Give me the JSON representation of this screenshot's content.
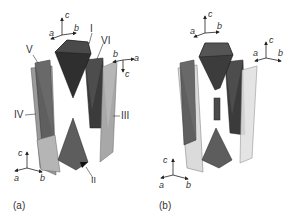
{
  "panels": [
    {
      "id": "a",
      "label": "(a)",
      "polyhedra_labels": [
        "I",
        "II",
        "III",
        "IV",
        "V",
        "VI"
      ],
      "axes_top": {
        "x": "a",
        "y": "b",
        "z": "c"
      },
      "axes_right": {
        "x": "a",
        "y": "b",
        "z": "c"
      },
      "axes_bottom": {
        "x": "a",
        "y": "b",
        "z": "c"
      }
    },
    {
      "id": "b",
      "label": "(b)",
      "axes_top": {
        "x": "a",
        "y": "b",
        "z": "c"
      },
      "axes_right": {
        "x": "a",
        "y": "b",
        "z": "c"
      },
      "axes_bottom": {
        "x": "a",
        "y": "b",
        "z": "c"
      }
    }
  ],
  "colors": {
    "dark": "#3a3a3a",
    "mid": "#6a6a6a",
    "light": "#b8b8b8",
    "pale": "#e0e0e0",
    "line": "#333333"
  }
}
